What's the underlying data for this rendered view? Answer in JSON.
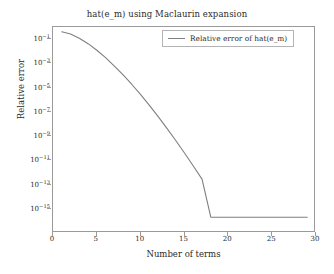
{
  "chart_data": {
    "type": "line",
    "title": "hat(e_m) using Maclaurin expansion",
    "xlabel": "Number of terms",
    "ylabel": "Relative error",
    "yscale": "log",
    "xlim": [
      0,
      30
    ],
    "ylim": [
      1e-17,
      1.0
    ],
    "grid": false,
    "legend_position": "top-right",
    "xticks": [
      0,
      5,
      10,
      15,
      20,
      25,
      30
    ],
    "xtick_labels": [
      "0",
      "5",
      "10",
      "15",
      "20",
      "25",
      "30"
    ],
    "yticks": [
      0.1,
      0.001,
      1e-05,
      1e-07,
      1e-09,
      1e-11,
      1e-13,
      1e-15
    ],
    "ytick_labels": [
      "10−1",
      "10−3",
      "10−5",
      "10−7",
      "10−9",
      "10−11",
      "10−13",
      "10−15"
    ],
    "ytick_mantissa": "10",
    "ytick_exponents": [
      "-1",
      "-3",
      "-5",
      "-7",
      "-9",
      "-11",
      "-13",
      "-15"
    ],
    "series": [
      {
        "name": "Relative error of hat(e_m)",
        "color": "#7f7f7f",
        "x": [
          1,
          2,
          3,
          4,
          5,
          6,
          7,
          8,
          9,
          10,
          11,
          12,
          13,
          14,
          15,
          16,
          17,
          18,
          19,
          20,
          21,
          22,
          23,
          24,
          25,
          26,
          27,
          28,
          29
        ],
        "y": [
          0.4,
          0.26,
          0.12,
          0.042,
          0.012,
          0.003,
          0.0006,
          0.00011,
          1.8e-05,
          2.6e-06,
          3.4e-07,
          4e-08,
          4.3e-09,
          4.3e-10,
          4e-11,
          3.4e-12,
          2.8e-13,
          2e-16,
          2e-16,
          2e-16,
          2e-16,
          2e-16,
          2e-16,
          2e-16,
          2e-16,
          2e-16,
          2e-16,
          2e-16,
          2e-16
        ]
      }
    ]
  },
  "legend": {
    "entries": [
      {
        "label": "Relative error of hat(e_m)"
      }
    ]
  },
  "colors": {
    "line": "#7f7f7f",
    "axis": "#9a9a9a",
    "text": "#2b2b2b",
    "background": "#ffffff"
  }
}
